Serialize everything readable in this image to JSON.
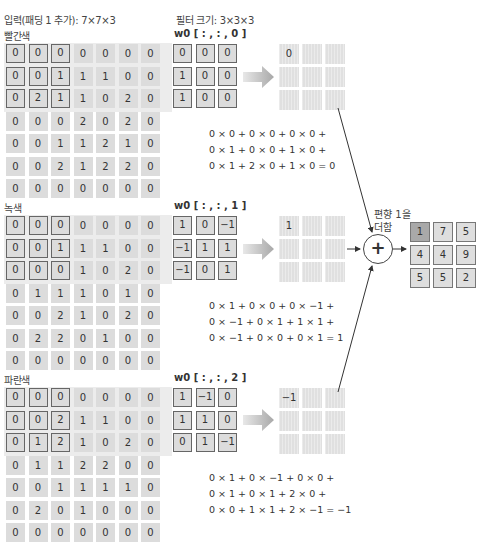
{
  "header": {
    "input_label": "입력(패딩 1 추가): 7×7×3",
    "filter_label": "필터 크기: 3×3×3"
  },
  "channels": [
    {
      "name": "빨간색",
      "weight_label": "w0 [ : , : , 0 ]",
      "input": [
        [
          "0",
          "0",
          "0",
          "0",
          "0",
          "0",
          "0"
        ],
        [
          "0",
          "0",
          "1",
          "1",
          "1",
          "0",
          "0"
        ],
        [
          "0",
          "2",
          "1",
          "1",
          "0",
          "2",
          "0"
        ],
        [
          "0",
          "0",
          "0",
          "2",
          "0",
          "2",
          "0"
        ],
        [
          "0",
          "0",
          "1",
          "1",
          "2",
          "1",
          "0"
        ],
        [
          "0",
          "0",
          "2",
          "1",
          "2",
          "2",
          "0"
        ],
        [
          "0",
          "0",
          "0",
          "0",
          "0",
          "0",
          "0"
        ]
      ],
      "filter": [
        [
          "0",
          "0",
          "0"
        ],
        [
          "1",
          "0",
          "0"
        ],
        [
          "1",
          "0",
          "0"
        ]
      ],
      "result_first": "0",
      "equation": [
        "0 × 0 + 0 × 0 + 0 × 0 +",
        "0 × 1 + 0 × 0 + 1 × 0 +",
        "0 × 1 + 2 × 0 + 1 × 0 = 0"
      ]
    },
    {
      "name": "녹색",
      "weight_label": "w0 [ : , : , 1 ]",
      "input": [
        [
          "0",
          "0",
          "0",
          "0",
          "0",
          "0",
          "0"
        ],
        [
          "0",
          "0",
          "1",
          "1",
          "1",
          "0",
          "0"
        ],
        [
          "0",
          "0",
          "0",
          "1",
          "0",
          "2",
          "0"
        ],
        [
          "0",
          "1",
          "1",
          "1",
          "0",
          "1",
          "0"
        ],
        [
          "0",
          "0",
          "2",
          "1",
          "0",
          "2",
          "0"
        ],
        [
          "0",
          "2",
          "2",
          "0",
          "1",
          "0",
          "0"
        ],
        [
          "0",
          "0",
          "0",
          "0",
          "0",
          "0",
          "0"
        ]
      ],
      "filter": [
        [
          "1",
          "0",
          "−1"
        ],
        [
          "−1",
          "1",
          "1"
        ],
        [
          "−1",
          "0",
          "1"
        ]
      ],
      "result_first": "1",
      "equation": [
        "0 × 1 + 0 × 0 + 0 × −1 +",
        "0 × −1 + 0 × 1 + 1 × 1 +",
        "0 × −1 + 0 × 0 + 0 × 1 = 1"
      ]
    },
    {
      "name": "파란색",
      "weight_label": "w0 [ : , : , 2 ]",
      "input": [
        [
          "0",
          "0",
          "0",
          "0",
          "0",
          "0",
          "0"
        ],
        [
          "0",
          "0",
          "2",
          "1",
          "1",
          "0",
          "0"
        ],
        [
          "0",
          "1",
          "2",
          "1",
          "0",
          "2",
          "0"
        ],
        [
          "0",
          "1",
          "1",
          "2",
          "2",
          "0",
          "0"
        ],
        [
          "0",
          "0",
          "1",
          "1",
          "1",
          "1",
          "0"
        ],
        [
          "0",
          "2",
          "0",
          "1",
          "0",
          "0",
          "0"
        ],
        [
          "0",
          "0",
          "0",
          "0",
          "0",
          "0",
          "0"
        ]
      ],
      "filter": [
        [
          "1",
          "−1",
          "0"
        ],
        [
          "1",
          "1",
          "0"
        ],
        [
          "0",
          "1",
          "−1"
        ]
      ],
      "result_first": "−1",
      "equation": [
        "0 × 1 + 0 × −1 + 0 × 0 +",
        "0 × 1 + 0 × 1 + 2 × 0 +",
        "0 × 0 + 1 × 1 + 2 × −1 = −1"
      ]
    }
  ],
  "sum": {
    "symbol": "+",
    "bias_line1": "편향 1을",
    "bias_line2": "더함"
  },
  "output": [
    [
      "1",
      "7",
      "5"
    ],
    [
      "4",
      "4",
      "9"
    ],
    [
      "5",
      "5",
      "2"
    ]
  ],
  "colors": {
    "cell_fill": "#dcdcdc",
    "frame": "#666666",
    "band": "#ececec",
    "highlight_output": "#a9a9a9"
  }
}
